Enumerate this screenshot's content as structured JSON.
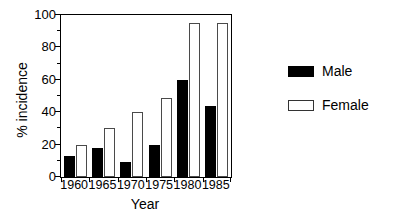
{
  "chart_data": {
    "type": "bar",
    "title": "",
    "xlabel": "Year",
    "ylabel": "% incidence",
    "categories": [
      "1960",
      "1965",
      "1970",
      "1975",
      "1980",
      "1985"
    ],
    "series": [
      {
        "name": "Male",
        "values": [
          13,
          18,
          9,
          20,
          60,
          44
        ],
        "color": "#000000",
        "fill": "solid"
      },
      {
        "name": "Female",
        "values": [
          20,
          30,
          40,
          49,
          95,
          95
        ],
        "color": "#ffffff",
        "fill": "open"
      }
    ],
    "ylim": [
      0,
      100
    ],
    "yticks": [
      0,
      20,
      40,
      60,
      80,
      100
    ],
    "ytick_labels": [
      "0",
      "20",
      "40",
      "60",
      "80",
      "100"
    ],
    "yminor_ticks": [
      10,
      30,
      50,
      70,
      90
    ],
    "grid": false,
    "legend_position": "right",
    "legend_entries": [
      "Male",
      "Female"
    ]
  }
}
